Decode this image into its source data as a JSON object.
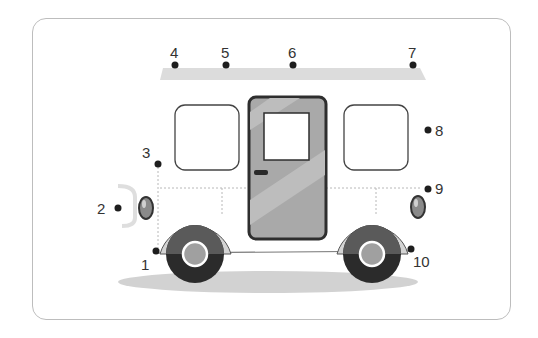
{
  "diagram": {
    "type": "connect-the-dots worksheet",
    "points": [
      {
        "label": "1",
        "x": 156,
        "y": 251
      },
      {
        "label": "2",
        "x": 118,
        "y": 208
      },
      {
        "label": "3",
        "x": 158,
        "y": 164
      },
      {
        "label": "4",
        "x": 175,
        "y": 65
      },
      {
        "label": "5",
        "x": 226,
        "y": 65
      },
      {
        "label": "6",
        "x": 293,
        "y": 65
      },
      {
        "label": "7",
        "x": 413,
        "y": 65
      },
      {
        "label": "8",
        "x": 428,
        "y": 130
      },
      {
        "label": "9",
        "x": 428,
        "y": 189
      },
      {
        "label": "10",
        "x": 411,
        "y": 249
      }
    ],
    "colors": {
      "roof_dotted": "#d9d9d9",
      "door_fill": "#a9a9a9",
      "door_stripe": "#bdbdbd",
      "outline": "#333333",
      "tire": "#2b2b2b",
      "tire_top": "#5a5a5a",
      "hub": "#a0a0a0",
      "fender": "#d4d4d4",
      "shadow": "#d2d2d2",
      "light": "#8a8a8a"
    }
  }
}
